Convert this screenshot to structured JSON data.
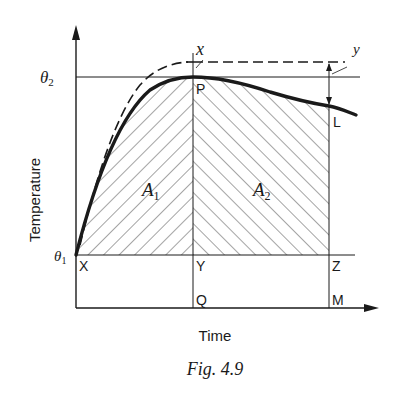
{
  "figure": {
    "caption": "Fig. 4.9",
    "y_axis_label": "Temperature",
    "x_axis_label": "Time",
    "theta1": "θ",
    "theta1_sub": "1",
    "theta2": "θ",
    "theta2_sub": "2",
    "area1": "A",
    "area1_sub": "1",
    "area2": "A",
    "area2_sub": "2",
    "points": {
      "P": "P",
      "L": "L",
      "X": "X",
      "Y": "Y",
      "Z": "Z",
      "Q": "Q",
      "M": "M"
    },
    "annotations": {
      "x": "x",
      "y": "y"
    }
  },
  "colors": {
    "ink": "#1a1a1a",
    "background": "#ffffff"
  }
}
